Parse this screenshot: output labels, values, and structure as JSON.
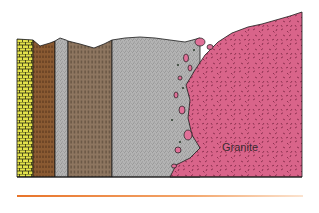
{
  "figure": {
    "type": "geologic-cross-section",
    "labels": {
      "granite": "Granite"
    },
    "units": [
      {
        "name": "yellow-brick-layer",
        "pattern": "brick",
        "color": "#e3e24a"
      },
      {
        "name": "brown-layer-1",
        "pattern": "dashed",
        "color": "#8a5a32"
      },
      {
        "name": "gray-fine-layer",
        "pattern": "stipple",
        "color": "#b9b9b9"
      },
      {
        "name": "brown-gray-layer",
        "pattern": "dashed",
        "color": "#8e7660"
      },
      {
        "name": "gray-stippled-layer",
        "pattern": "stipple",
        "color": "#aeaeae"
      },
      {
        "name": "granite",
        "pattern": "random-dashes",
        "color": "#d9648a"
      }
    ],
    "colors": {
      "outline": "#1a1a1a",
      "rule": "#e8742a",
      "xenolith": "#e07098"
    }
  }
}
